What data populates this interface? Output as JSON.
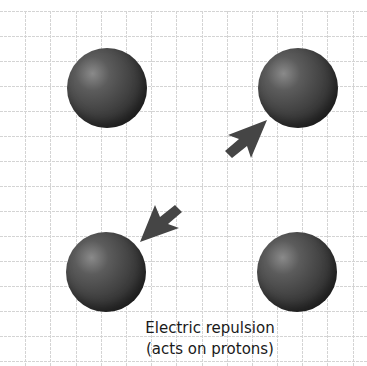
{
  "diagram": {
    "caption": {
      "line1": "Electric repulsion",
      "line2": "(acts on protons)"
    },
    "particles": [
      {
        "name": "proton-top-left",
        "type": "proton"
      },
      {
        "name": "proton-top-right",
        "type": "proton"
      },
      {
        "name": "proton-bottom-left",
        "type": "proton"
      },
      {
        "name": "proton-bottom-right",
        "type": "proton"
      }
    ],
    "arrows": [
      {
        "name": "force-arrow-top-right",
        "direction": "up-right",
        "target": "proton-top-right"
      },
      {
        "name": "force-arrow-bottom-left",
        "direction": "down-left",
        "target": "proton-bottom-left"
      }
    ],
    "colors": {
      "background": "#ffffff",
      "grid": "#d0d0d0",
      "sphere": "#3a3a3a",
      "arrow": "#444444",
      "text": "#1a1a1a"
    }
  }
}
